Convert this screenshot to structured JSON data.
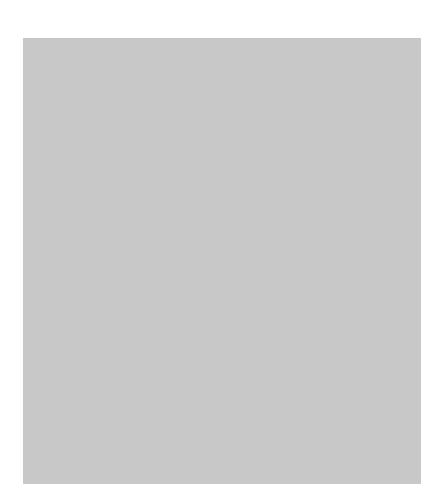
{
  "chart_data": {
    "type": "area",
    "title": "",
    "xlabel": "",
    "ylabel": "Employees (millions)",
    "ylim": [
      0,
      20
    ],
    "yticks": [
      0,
      2,
      4,
      6,
      8,
      10,
      12,
      14,
      16,
      18,
      20
    ],
    "xticks": [
      "1950",
      "1965",
      "1980",
      "1995"
    ],
    "x": [
      1950,
      1955,
      1960,
      1965,
      1970,
      1975,
      1980,
      1985,
      1990,
      1995
    ],
    "series": [
      {
        "name": "Federal",
        "label": "Federal",
        "sublabel": "2.7million",
        "color": "#6e6e6e",
        "values": [
          1.5,
          2.0,
          2.2,
          2.4,
          2.6,
          2.8,
          2.9,
          3.1,
          3.1,
          2.9
        ]
      },
      {
        "name": "State and Local",
        "label": "State and Local",
        "sublabel": "15.5 million",
        "color": "#e4e4e4",
        "values": [
          2.4,
          2.2,
          4.0,
          5.6,
          7.2,
          10.2,
          12.3,
          12.9,
          13.0,
          12.6
        ]
      }
    ],
    "total_top": [
      5.8,
      6.2,
      8.0,
      10.8,
      13.3,
      15.6,
      16.4,
      16.6,
      16.9,
      17.1
    ],
    "grid": true,
    "style": "3d-stacked-area"
  }
}
